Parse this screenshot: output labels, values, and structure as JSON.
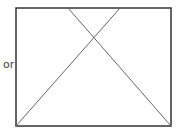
{
  "label": "or",
  "shapes": {
    "rect": {
      "x": 16,
      "y": 8,
      "w": 155,
      "h": 118,
      "stroke": "#333333"
    },
    "line1": {
      "x1": 68,
      "y1": 8,
      "x2": 171,
      "y2": 126,
      "stroke": "#666666"
    },
    "line2": {
      "x1": 120,
      "y1": 8,
      "x2": 16,
      "y2": 126,
      "stroke": "#666666"
    }
  }
}
